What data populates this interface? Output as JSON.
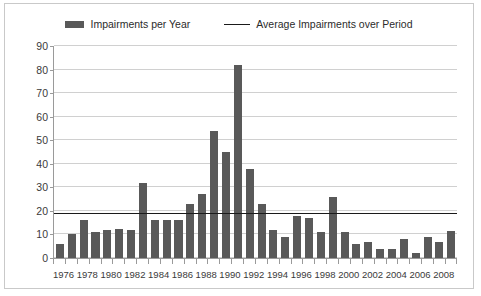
{
  "legend": {
    "entries": [
      {
        "label": "Impairments per Year",
        "marker": "bar-swatch",
        "color": "#595959"
      },
      {
        "label": "Average Impairments over Period",
        "marker": "line-swatch",
        "color": "#1a1a1a"
      }
    ]
  },
  "chart_data": {
    "type": "bar",
    "title": "",
    "xlabel": "",
    "ylabel": "",
    "ylim": [
      0,
      90
    ],
    "ytick_step": 10,
    "yticks": [
      0,
      10,
      20,
      30,
      40,
      50,
      60,
      70,
      80,
      90
    ],
    "grid": true,
    "legend_position": "top-center",
    "categories": [
      "1976",
      "1977",
      "1978",
      "1979",
      "1980",
      "1981",
      "1982",
      "1983",
      "1984",
      "1985",
      "1986",
      "1987",
      "1988",
      "1989",
      "1990",
      "1991",
      "1992",
      "1993",
      "1994",
      "1995",
      "1996",
      "1997",
      "1998",
      "1999",
      "2000",
      "2001",
      "2002",
      "2003",
      "2004",
      "2005",
      "2006",
      "2007",
      "2008",
      "2009"
    ],
    "xtick_labels_shown": [
      "1976",
      "1978",
      "1980",
      "1982",
      "1984",
      "1986",
      "1988",
      "1990",
      "1992",
      "1994",
      "1996",
      "1998",
      "2000",
      "2002",
      "2004",
      "2006",
      "2008"
    ],
    "series": [
      {
        "name": "Impairments per Year",
        "type": "bar",
        "color": "#595959",
        "values": [
          6,
          10,
          16,
          11,
          12,
          12.5,
          12,
          32,
          16,
          16,
          16,
          23,
          27,
          54,
          45,
          82,
          38,
          23,
          12,
          9,
          18,
          17,
          11,
          26,
          11,
          6,
          7,
          4,
          4,
          8,
          2,
          9,
          7,
          11.5
        ]
      },
      {
        "name": "Average Impairments over Period",
        "type": "line",
        "color": "#1a1a1a",
        "value": 18.7
      }
    ]
  }
}
